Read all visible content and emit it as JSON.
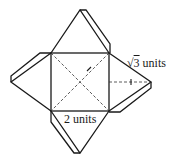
{
  "diagram": {
    "type": "net of square pyramid",
    "base_side_label": "2 units",
    "slant_height_label": {
      "radical": "√",
      "radicand": "3",
      "unit": " units"
    },
    "colors": {
      "stroke": "#1a1a1a",
      "background": "#ffffff"
    }
  }
}
